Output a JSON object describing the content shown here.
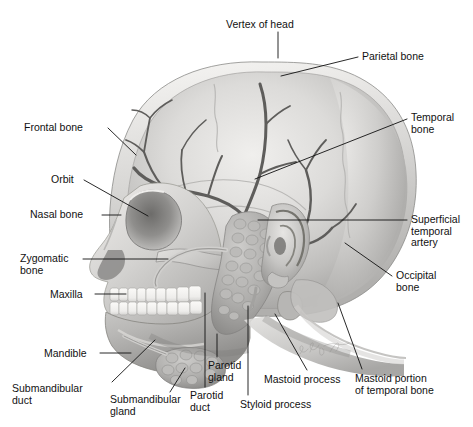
{
  "figure": {
    "view": "lateral (side) view of human head",
    "style": "grayscale airbrush medical illustration",
    "background_color": "#ffffff",
    "artist_signature": "illustrator signature (cursive, faint)",
    "palette": {
      "bone_light": "#e8e7e5",
      "bone_mid": "#c9c8c6",
      "bone_shadow": "#9b9a98",
      "bone_dark": "#6f6e6c",
      "artery": "#5e5d5b",
      "gland": "#a3a2a0",
      "tooth": "#f5f4f1",
      "leader_line": "#111111",
      "label_text": "#111111"
    }
  },
  "labels": [
    {
      "id": "vertex-of-head",
      "text": "Vertex of head",
      "align": "center",
      "x": 226,
      "y": 19,
      "leader": [
        [
          278,
          32
        ],
        [
          278,
          58
        ]
      ]
    },
    {
      "id": "parietal-bone",
      "text": "Parietal bone",
      "align": "left",
      "x": 362,
      "y": 51,
      "leader": [
        [
          358,
          57
        ],
        [
          281,
          76
        ]
      ]
    },
    {
      "id": "frontal-bone",
      "text": "Frontal bone",
      "align": "left",
      "x": 24,
      "y": 122,
      "leader": [
        [
          108,
          128
        ],
        [
          136,
          155
        ]
      ]
    },
    {
      "id": "temporal-bone",
      "text": "Temporal\nbone",
      "align": "left",
      "x": 411,
      "y": 112,
      "leader": [
        [
          407,
          119
        ],
        [
          255,
          179
        ]
      ]
    },
    {
      "id": "orbit",
      "text": "Orbit",
      "align": "left",
      "x": 51,
      "y": 174,
      "leader": [
        [
          84,
          180
        ],
        [
          148,
          216
        ]
      ]
    },
    {
      "id": "nasal-bone",
      "text": "Nasal bone",
      "align": "left",
      "x": 30,
      "y": 209,
      "leader": [
        [
          102,
          215
        ],
        [
          121,
          215
        ]
      ]
    },
    {
      "id": "superficial-temporal-artery",
      "text": "Superficial\ntemporal\nartery",
      "align": "left",
      "x": 411,
      "y": 214,
      "leader": [
        [
          407,
          220
        ],
        [
          258,
          220
        ]
      ]
    },
    {
      "id": "zygomatic-bone",
      "text": "Zygomatic\nbone",
      "align": "left",
      "x": 20,
      "y": 253,
      "leader": [
        [
          83,
          259
        ],
        [
          168,
          259
        ]
      ]
    },
    {
      "id": "occipital-bone",
      "text": "Occipital\nbone",
      "align": "left",
      "x": 396,
      "y": 270,
      "leader": [
        [
          392,
          276
        ],
        [
          345,
          243
        ]
      ]
    },
    {
      "id": "maxilla",
      "text": "Maxilla",
      "align": "left",
      "x": 50,
      "y": 289,
      "leader": [
        [
          95,
          294
        ],
        [
          126,
          294
        ]
      ]
    },
    {
      "id": "mandible",
      "text": "Mandible",
      "align": "left",
      "x": 44,
      "y": 348,
      "leader": [
        [
          100,
          353
        ],
        [
          131,
          353
        ]
      ]
    },
    {
      "id": "submandibular-duct",
      "text": "Submandibular\nduct",
      "align": "left",
      "x": 12,
      "y": 383,
      "leader": [
        [
          112,
          382
        ],
        [
          155,
          340
        ]
      ]
    },
    {
      "id": "submandibular-gland",
      "text": "Submandibular\ngland",
      "align": "left",
      "x": 110,
      "y": 394,
      "leader": [
        [
          170,
          392
        ],
        [
          185,
          368
        ]
      ]
    },
    {
      "id": "parotid-gland",
      "text": "Parotid\ngland",
      "align": "left",
      "x": 208,
      "y": 360,
      "leader": [
        [
          217,
          357
        ],
        [
          217,
          334
        ]
      ]
    },
    {
      "id": "parotid-duct",
      "text": "Parotid\nduct",
      "align": "left",
      "x": 190,
      "y": 390,
      "leader": [
        [
          205,
          387
        ],
        [
          205,
          293
        ]
      ]
    },
    {
      "id": "styloid-process",
      "text": "Styloid process",
      "align": "left",
      "x": 240,
      "y": 399,
      "leader": [
        [
          248,
          395
        ],
        [
          248,
          306
        ]
      ]
    },
    {
      "id": "mastoid-process",
      "text": "Mastoid process",
      "align": "left",
      "x": 264,
      "y": 374,
      "leader": [
        [
          307,
          370
        ],
        [
          275,
          314
        ]
      ]
    },
    {
      "id": "mastoid-portion-of-temporal-bone",
      "text": "Mastoid portion\nof temporal bone",
      "align": "left",
      "x": 355,
      "y": 373,
      "leader": [
        [
          362,
          369
        ],
        [
          338,
          303
        ]
      ]
    }
  ],
  "structures": [
    {
      "id": "cranium",
      "name": "Cranial vault / calvaria"
    },
    {
      "id": "frontal-bone",
      "name": "Frontal bone"
    },
    {
      "id": "parietal-bone",
      "name": "Parietal bone"
    },
    {
      "id": "temporal-bone",
      "name": "Temporal bone"
    },
    {
      "id": "occipital-bone",
      "name": "Occipital bone"
    },
    {
      "id": "orbit",
      "name": "Orbit (eye socket)"
    },
    {
      "id": "nasal-bone",
      "name": "Nasal bone"
    },
    {
      "id": "zygomatic-bone",
      "name": "Zygomatic bone / arch"
    },
    {
      "id": "maxilla",
      "name": "Maxilla with upper teeth"
    },
    {
      "id": "mandible",
      "name": "Mandible with lower teeth"
    },
    {
      "id": "external-ear",
      "name": "Auricle (external ear)"
    },
    {
      "id": "parotid-gland",
      "name": "Parotid gland"
    },
    {
      "id": "parotid-duct",
      "name": "Parotid (Stensen's) duct"
    },
    {
      "id": "submandibular-gland",
      "name": "Submandibular gland"
    },
    {
      "id": "submandibular-duct",
      "name": "Submandibular (Wharton's) duct"
    },
    {
      "id": "superficial-temporal-artery",
      "name": "Superficial temporal artery and branches"
    },
    {
      "id": "mastoid-process",
      "name": "Mastoid process"
    },
    {
      "id": "styloid-process",
      "name": "Styloid process"
    },
    {
      "id": "coronal-suture",
      "name": "Coronal suture"
    },
    {
      "id": "squamous-suture",
      "name": "Squamous suture"
    },
    {
      "id": "lambdoid-suture",
      "name": "Lambdoid suture"
    }
  ]
}
